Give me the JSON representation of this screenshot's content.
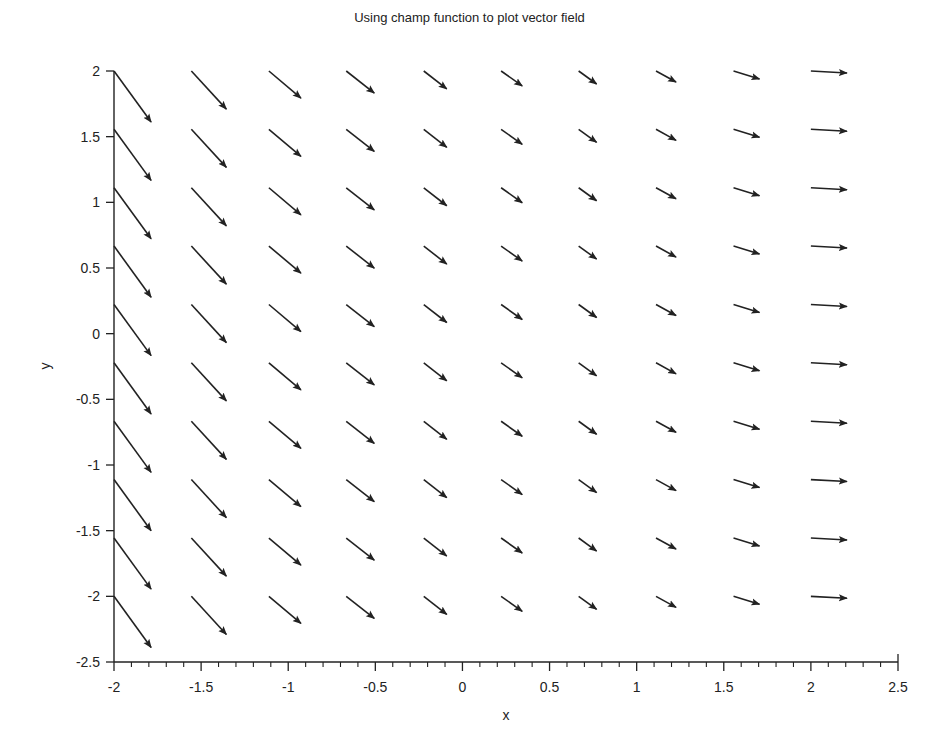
{
  "chart_data": {
    "type": "quiver",
    "title": "Using champ function to plot vector field",
    "xlabel": "x",
    "ylabel": "y",
    "xlim": [
      -2,
      2.5
    ],
    "ylim": [
      -2.5,
      2
    ],
    "xticks": [
      -2,
      -1.5,
      -1,
      -0.5,
      0,
      0.5,
      1,
      1.5,
      2,
      2.5
    ],
    "xtick_labels": [
      "-2",
      "-1.5",
      "-1",
      "-0.5",
      "0",
      "0.5",
      "1",
      "1.5",
      "2",
      "2.5"
    ],
    "yticks": [
      2,
      1.5,
      1,
      0.5,
      0,
      -0.5,
      -1,
      -1.5,
      -2,
      -2.5
    ],
    "ytick_labels": [
      "2",
      "1.5",
      "1",
      "0.5",
      "0",
      "-0.5",
      "-1",
      "-1.5",
      "-2",
      "-2.5"
    ],
    "x_minor_ticks_per_major": 5,
    "grid": false,
    "legend": null,
    "grid_x": [
      -2,
      -1.556,
      -1.111,
      -0.667,
      -0.222,
      0.222,
      0.667,
      1.111,
      1.556,
      2
    ],
    "grid_y": [
      2,
      1.556,
      1.111,
      0.667,
      0.222,
      -0.222,
      -0.667,
      -1.111,
      -1.556,
      -2
    ],
    "vectors_by_column": [
      {
        "x": -2,
        "u": 0.213,
        "v": -0.389
      },
      {
        "x": -1.556,
        "u": 0.201,
        "v": -0.29
      },
      {
        "x": -1.111,
        "u": 0.184,
        "v": -0.206
      },
      {
        "x": -0.667,
        "u": 0.161,
        "v": -0.168
      },
      {
        "x": -0.222,
        "u": 0.132,
        "v": -0.137
      },
      {
        "x": 0.222,
        "u": 0.121,
        "v": -0.114
      },
      {
        "x": 0.667,
        "u": 0.103,
        "v": -0.099
      },
      {
        "x": 1.111,
        "u": 0.115,
        "v": -0.084
      },
      {
        "x": 1.556,
        "u": 0.149,
        "v": -0.061
      },
      {
        "x": 2,
        "u": 0.207,
        "v": -0.015
      }
    ],
    "note": "vectors identical within each column; arrow color black"
  },
  "style": {
    "arrow_color": "#222222",
    "axis_color": "#222222",
    "background": "#ffffff"
  }
}
